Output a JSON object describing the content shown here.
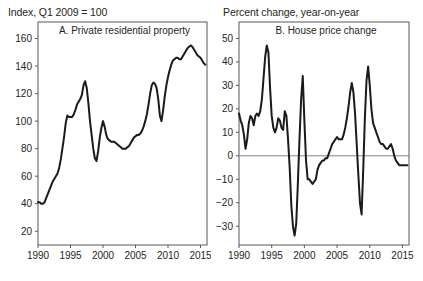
{
  "figure": {
    "panels": [
      {
        "key": "a",
        "header": "Index, Q1 2009 = 100",
        "title": "A. Private residential property"
      },
      {
        "key": "b",
        "header": "Percent change, year-on-year",
        "title": "B. House price change"
      }
    ]
  },
  "chart_data": [
    {
      "type": "line",
      "panel": "A",
      "title": "A. Private residential property",
      "ylabel": "Index, Q1 2009 = 100",
      "xlabel": "",
      "xlim": [
        1990,
        2016
      ],
      "ylim": [
        10,
        172
      ],
      "yticks": [
        20,
        40,
        60,
        80,
        100,
        120,
        140,
        160
      ],
      "xticks": [
        1990,
        1995,
        2000,
        2005,
        2010,
        2015
      ],
      "grid": false,
      "legend": "none",
      "series": [
        {
          "name": "Private residential property price index",
          "x": [
            1990.0,
            1990.25,
            1990.5,
            1990.75,
            1991.0,
            1991.25,
            1991.5,
            1991.75,
            1992.0,
            1992.25,
            1992.5,
            1992.75,
            1993.0,
            1993.25,
            1993.5,
            1993.75,
            1994.0,
            1994.25,
            1994.5,
            1994.75,
            1995.0,
            1995.25,
            1995.5,
            1995.75,
            1996.0,
            1996.25,
            1996.5,
            1996.75,
            1997.0,
            1997.25,
            1997.5,
            1997.75,
            1998.0,
            1998.25,
            1998.5,
            1998.75,
            1999.0,
            1999.25,
            1999.5,
            1999.75,
            2000.0,
            2000.25,
            2000.5,
            2000.75,
            2001.0,
            2001.25,
            2001.5,
            2001.75,
            2002.0,
            2002.25,
            2002.5,
            2002.75,
            2003.0,
            2003.25,
            2003.5,
            2003.75,
            2004.0,
            2004.25,
            2004.5,
            2004.75,
            2005.0,
            2005.25,
            2005.5,
            2005.75,
            2006.0,
            2006.25,
            2006.5,
            2006.75,
            2007.0,
            2007.25,
            2007.5,
            2007.75,
            2008.0,
            2008.25,
            2008.5,
            2008.75,
            2009.0,
            2009.25,
            2009.5,
            2009.75,
            2010.0,
            2010.25,
            2010.5,
            2010.75,
            2011.0,
            2011.25,
            2011.5,
            2011.75,
            2012.0,
            2012.25,
            2012.5,
            2012.75,
            2013.0,
            2013.25,
            2013.5,
            2013.75,
            2014.0,
            2014.25,
            2014.5,
            2014.75,
            2015.0,
            2015.25,
            2015.5,
            2015.75
          ],
          "y": [
            41,
            41,
            40,
            40,
            41,
            44,
            47,
            50,
            53,
            56,
            58,
            60,
            62,
            66,
            72,
            80,
            88,
            98,
            104,
            103,
            103,
            103,
            105,
            108,
            112,
            114,
            116,
            119,
            126,
            129,
            124,
            113,
            100,
            90,
            80,
            73,
            71,
            78,
            88,
            95,
            100,
            96,
            90,
            87,
            86,
            85,
            85,
            85,
            84,
            83,
            82,
            81,
            80,
            80,
            80,
            81,
            82,
            84,
            86,
            88,
            89,
            90,
            90,
            91,
            93,
            96,
            100,
            105,
            112,
            120,
            126,
            128,
            127,
            124,
            116,
            104,
            100,
            108,
            118,
            126,
            132,
            137,
            141,
            144,
            145,
            146,
            146,
            145,
            145,
            147,
            149,
            151,
            153,
            154,
            155,
            154,
            152,
            150,
            148,
            147,
            146,
            144,
            142,
            141
          ]
        }
      ]
    },
    {
      "type": "line",
      "panel": "B",
      "title": "B. House price change",
      "ylabel": "Percent change, year-on-year",
      "xlabel": "",
      "xlim": [
        1990,
        2016
      ],
      "ylim": [
        -38,
        57
      ],
      "yticks": [
        -30,
        -20,
        -10,
        0,
        10,
        20,
        30,
        40,
        50
      ],
      "xticks": [
        1990,
        1995,
        2000,
        2005,
        2010,
        2015
      ],
      "grid": false,
      "zeroline": 0,
      "legend": "none",
      "series": [
        {
          "name": "House price change, year-on-year",
          "x": [
            1990.0,
            1990.25,
            1990.5,
            1990.75,
            1991.0,
            1991.25,
            1991.5,
            1991.75,
            1992.0,
            1992.25,
            1992.5,
            1992.75,
            1993.0,
            1993.25,
            1993.5,
            1993.75,
            1994.0,
            1994.25,
            1994.5,
            1994.75,
            1995.0,
            1995.25,
            1995.5,
            1995.75,
            1996.0,
            1996.25,
            1996.5,
            1996.75,
            1997.0,
            1997.25,
            1997.5,
            1997.75,
            1998.0,
            1998.25,
            1998.5,
            1998.75,
            1999.0,
            1999.25,
            1999.5,
            1999.75,
            2000.0,
            2000.25,
            2000.5,
            2000.75,
            2001.0,
            2001.25,
            2001.5,
            2001.75,
            2002.0,
            2002.25,
            2002.5,
            2002.75,
            2003.0,
            2003.25,
            2003.5,
            2003.75,
            2004.0,
            2004.25,
            2004.5,
            2004.75,
            2005.0,
            2005.25,
            2005.5,
            2005.75,
            2006.0,
            2006.25,
            2006.5,
            2006.75,
            2007.0,
            2007.25,
            2007.5,
            2007.75,
            2008.0,
            2008.25,
            2008.5,
            2008.75,
            2009.0,
            2009.25,
            2009.5,
            2009.75,
            2010.0,
            2010.25,
            2010.5,
            2010.75,
            2011.0,
            2011.25,
            2011.5,
            2011.75,
            2012.0,
            2012.25,
            2012.5,
            2012.75,
            2013.0,
            2013.25,
            2013.5,
            2013.75,
            2014.0,
            2014.25,
            2014.5,
            2014.75,
            2015.0,
            2015.25,
            2015.5,
            2015.75
          ],
          "y": [
            18,
            15,
            13,
            9,
            3,
            7,
            14,
            17,
            16,
            13,
            17,
            18,
            17,
            19,
            24,
            33,
            42,
            47,
            44,
            29,
            17,
            12,
            10,
            12,
            16,
            15,
            12,
            11,
            19,
            17,
            7,
            -5,
            -21,
            -30,
            -34,
            -29,
            -12,
            7,
            24,
            34,
            15,
            -2,
            -10,
            -10,
            -11,
            -12,
            -11,
            -10,
            -6,
            -4,
            -3,
            -2,
            -2,
            -1,
            -1,
            1,
            3,
            5,
            6,
            7,
            8,
            7,
            7,
            7,
            9,
            12,
            16,
            21,
            27,
            31,
            27,
            18,
            5,
            -8,
            -20,
            -25,
            -6,
            16,
            32,
            38,
            30,
            20,
            14,
            12,
            10,
            8,
            6,
            5,
            5,
            4,
            3,
            3,
            4,
            5,
            3,
            0,
            -2,
            -3,
            -4,
            -4,
            -4,
            -4,
            -4,
            -4
          ]
        }
      ]
    }
  ]
}
